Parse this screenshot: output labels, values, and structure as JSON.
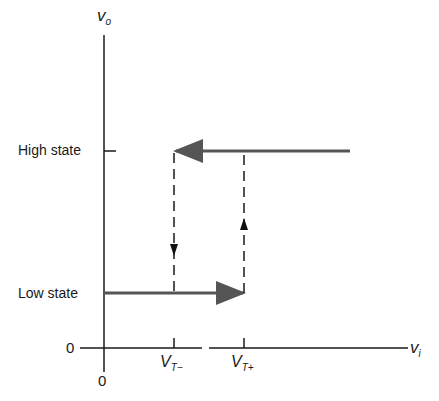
{
  "diagram": {
    "y_axis_label": "v",
    "y_axis_sub": "o",
    "x_axis_label": "v",
    "x_axis_sub": "i",
    "y_zero": "0",
    "x_zero": "0",
    "high_state_label": "High state",
    "low_state_label": "Low state",
    "thresholds": [
      {
        "label": "V",
        "sub": "T−"
      },
      {
        "label": "V",
        "sub": "T+"
      }
    ],
    "colors": {
      "axis": "#1a1a1a",
      "path": "#555555"
    }
  }
}
